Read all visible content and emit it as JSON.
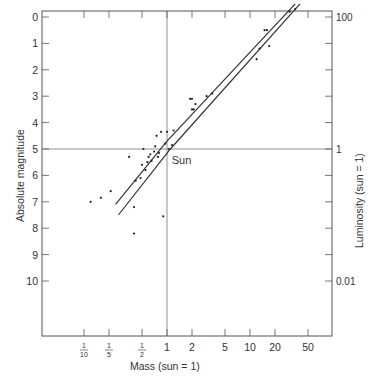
{
  "chart_data": {
    "type": "scatter",
    "title": "",
    "xlabel": "Mass (sun = 1)",
    "ylabel": "Absolute magnitude",
    "y2label": "Luminosity (sun = 1)",
    "x_scale": "log",
    "xlim": [
      0.055,
      80
    ],
    "ylim": [
      11.5,
      -1.2
    ],
    "x_ticks": [
      {
        "value": 0.1,
        "num": "1",
        "den": "10"
      },
      {
        "value": 0.2,
        "num": "1",
        "den": "5"
      },
      {
        "value": 0.5,
        "num": "1",
        "den": "2"
      },
      {
        "value": 1,
        "label": "1"
      },
      {
        "value": 2,
        "label": "2"
      },
      {
        "value": 5,
        "label": "5"
      },
      {
        "value": 10,
        "label": "10"
      },
      {
        "value": 20,
        "label": "20"
      },
      {
        "value": 50,
        "label": "50"
      }
    ],
    "y_ticks": [
      -1,
      0,
      1,
      2,
      3,
      4,
      5,
      6,
      7,
      8,
      9,
      10
    ],
    "y_tick_labels": [
      "-1",
      "0",
      "1",
      "2",
      "3",
      "4",
      "5",
      "6",
      "7",
      "8",
      "9",
      "10"
    ],
    "y2_ticks": [
      {
        "magnitude": 0,
        "label": "100"
      },
      {
        "magnitude": 5,
        "label": "1"
      },
      {
        "magnitude": 10,
        "label": "0.01"
      }
    ],
    "y2_minor_ticks": [
      -1,
      1,
      2,
      3,
      4,
      6,
      7,
      8,
      9
    ],
    "reference_lines": {
      "x": 1,
      "y": 5
    },
    "annotation": {
      "text": "Sun",
      "mass": 1.05,
      "magnitude": 5.5
    },
    "band_lines": [
      {
        "name": "upper",
        "points": [
          [
            0.24,
            7.1
          ],
          [
            1.0,
            4.7
          ],
          [
            35,
            -0.5
          ]
        ]
      },
      {
        "name": "lower",
        "points": [
          [
            0.26,
            7.5
          ],
          [
            1.1,
            5.0
          ],
          [
            40,
            -0.5
          ]
        ]
      }
    ],
    "series": [
      {
        "name": "stars",
        "points": [
          [
            0.12,
            7.0
          ],
          [
            0.16,
            6.85
          ],
          [
            0.21,
            6.6
          ],
          [
            0.35,
            5.3
          ],
          [
            0.4,
            7.2
          ],
          [
            0.4,
            8.2
          ],
          [
            0.42,
            6.2
          ],
          [
            0.48,
            6.1
          ],
          [
            0.5,
            5.6
          ],
          [
            0.52,
            5.0
          ],
          [
            0.55,
            5.8
          ],
          [
            0.58,
            5.5
          ],
          [
            0.6,
            5.3
          ],
          [
            0.63,
            5.2
          ],
          [
            0.65,
            5.45
          ],
          [
            0.7,
            5.1
          ],
          [
            0.72,
            4.9
          ],
          [
            0.75,
            4.5
          ],
          [
            0.78,
            5.3
          ],
          [
            0.8,
            5.15
          ],
          [
            0.85,
            4.35
          ],
          [
            0.9,
            7.55
          ],
          [
            0.95,
            4.8
          ],
          [
            1.0,
            4.35
          ],
          [
            1.05,
            5.0
          ],
          [
            1.2,
            4.3
          ],
          [
            1.15,
            4.85
          ],
          [
            1.9,
            3.1
          ],
          [
            2.0,
            3.1
          ],
          [
            2.0,
            3.5
          ],
          [
            2.1,
            3.5
          ],
          [
            2.2,
            3.3
          ],
          [
            3.0,
            3.0
          ],
          [
            3.5,
            2.9
          ],
          [
            12,
            1.6
          ],
          [
            13,
            1.2
          ],
          [
            15,
            0.5
          ],
          [
            16,
            0.5
          ],
          [
            17,
            1.1
          ],
          [
            30,
            -0.2
          ],
          [
            35,
            -0.3
          ],
          [
            38,
            -0.9
          ],
          [
            40,
            -0.8
          ]
        ]
      }
    ],
    "grid": false,
    "legend": null
  },
  "colors": {
    "axis": "#555555",
    "points": "#222222",
    "lines": "#333333",
    "text": "#333333"
  }
}
